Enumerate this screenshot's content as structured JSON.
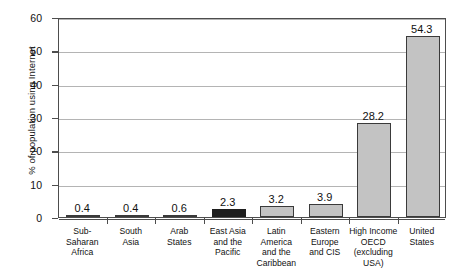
{
  "chart_data": {
    "type": "bar",
    "title": "",
    "subtitle": "",
    "xlabel": "",
    "ylabel": "% of population using Internet",
    "ylim": [
      0,
      60
    ],
    "yticks": [
      0,
      10,
      20,
      30,
      40,
      50,
      60
    ],
    "ytick_labels": [
      "0",
      "10",
      "20",
      "30",
      "40",
      "50",
      "60"
    ],
    "grid": "horizontal",
    "legend": "none",
    "categories": [
      "Sub-Saharan Africa",
      "South Asia",
      "Arab States",
      "East Asia and the Pacific",
      "Latin America and the Caribbean",
      "Eastern Europe and CIS",
      "High Income OECD (excluding USA)",
      "United States"
    ],
    "category_label_lines": [
      [
        "Sub-Saharan",
        "Africa"
      ],
      [
        "South",
        "Asia"
      ],
      [
        "Arab",
        "States"
      ],
      [
        "East Asia",
        "and the",
        "Pacific"
      ],
      [
        "Latin",
        "America",
        "and the",
        "Caribbean"
      ],
      [
        "Eastern",
        "Europe",
        "and CIS"
      ],
      [
        "High Income",
        "OECD",
        "(excluding USA)"
      ],
      [
        "United",
        "States"
      ]
    ],
    "values": [
      0.4,
      0.4,
      0.6,
      2.3,
      3.2,
      3.9,
      28.2,
      54.3
    ],
    "value_labels": [
      "0.4",
      "0.4",
      "0.6",
      "2.3",
      "3.2",
      "3.9",
      "28.2",
      "54.3"
    ],
    "bar_colors": [
      "#c3c3c3",
      "#c3c3c3",
      "#c3c3c3",
      "#1e1e1e",
      "#c3c3c3",
      "#c3c3c3",
      "#c3c3c3",
      "#c3c3c3"
    ],
    "highlighted_category": "East Asia and the Pacific",
    "colors": {
      "bar_gray": "#c3c3c3",
      "bar_dark": "#1e1e1e",
      "bar_border": "#3a3a3a",
      "axis": "#4d4d4d",
      "gridline": "#b4b4b4",
      "text": "#111111",
      "background": "#ffffff"
    }
  }
}
